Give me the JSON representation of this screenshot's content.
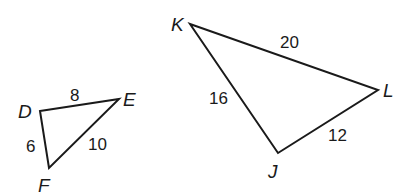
{
  "diagram": {
    "type": "similar-triangles",
    "triangles": [
      {
        "name": "DEF",
        "vertices": [
          {
            "label": "D",
            "x": 40,
            "y": 111,
            "lx": 18,
            "ly": 118
          },
          {
            "label": "E",
            "x": 119,
            "y": 99,
            "lx": 123,
            "ly": 106
          },
          {
            "label": "F",
            "x": 49,
            "y": 168,
            "lx": 38,
            "ly": 192
          }
        ],
        "sides": [
          {
            "between": "DE",
            "length": "8",
            "lx": 70,
            "ly": 101
          },
          {
            "between": "DF",
            "length": "6",
            "lx": 26,
            "ly": 152
          },
          {
            "between": "EF",
            "length": "10",
            "lx": 88,
            "ly": 150
          }
        ]
      },
      {
        "name": "KLJ",
        "vertices": [
          {
            "label": "K",
            "x": 190,
            "y": 24,
            "lx": 171,
            "ly": 31
          },
          {
            "label": "L",
            "x": 378,
            "y": 90,
            "lx": 383,
            "ly": 97
          },
          {
            "label": "J",
            "x": 278,
            "y": 153,
            "lx": 268,
            "ly": 178
          }
        ],
        "sides": [
          {
            "between": "KL",
            "length": "20",
            "lx": 280,
            "ly": 48
          },
          {
            "between": "KJ",
            "length": "16",
            "lx": 209,
            "ly": 104
          },
          {
            "between": "LJ",
            "length": "12",
            "lx": 328,
            "ly": 141
          }
        ]
      }
    ]
  }
}
